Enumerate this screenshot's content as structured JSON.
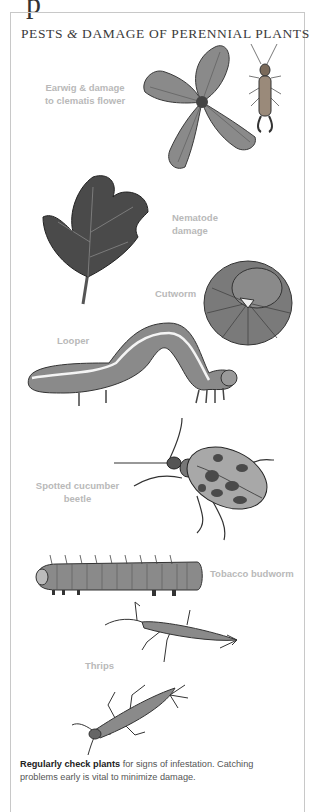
{
  "header": {
    "title_part1": "PESTS ",
    "title_amp": "&",
    "title_part2": " DAMAGE OF PERENNIAL PLANTS"
  },
  "labels": {
    "earwig_line1": "Earwig & damage",
    "earwig_line2": "to clematis flower",
    "nematode_line1": "Nematode",
    "nematode_line2": "damage",
    "cutworm": "Cutworm",
    "looper": "Looper",
    "beetle_line1": "Spotted cucumber",
    "beetle_line2": "beetle",
    "budworm": "Tobacco budworm",
    "thrips": "Thrips"
  },
  "caption": {
    "bold": "Regularly check plants",
    "rest": " for signs of infestation. Catching problems early is vital to minimize damage."
  },
  "illustrations": [
    "clematis-flower",
    "earwig",
    "nematode-leaf",
    "cutworm",
    "looper",
    "spotted-cucumber-beetle",
    "tobacco-budworm",
    "thrips-1",
    "thrips-2"
  ]
}
